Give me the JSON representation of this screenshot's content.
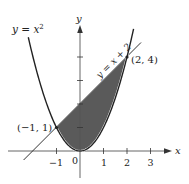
{
  "chart_data": {
    "type": "area",
    "title": "",
    "xlabel": "x",
    "ylabel": "y",
    "xlim": [
      -2.5,
      3.8
    ],
    "ylim": [
      -0.6,
      5.4
    ],
    "grid": false,
    "x_ticks": [
      -1,
      0,
      1,
      2,
      3
    ],
    "x_tick_labels": [
      "−1",
      "0",
      "1",
      "2",
      "3"
    ],
    "y_ticks": [
      1,
      2,
      3,
      4
    ],
    "series": [
      {
        "name": "y = x^2",
        "kind": "curve",
        "equation": "y = x^2",
        "x_range": [
          -2.2,
          2.28
        ]
      },
      {
        "name": "y = x + 2",
        "kind": "line",
        "equation": "y = x + 2",
        "x_range": [
          -2.4,
          2.6
        ]
      }
    ],
    "shaded_region": {
      "between": [
        "y = x + 2",
        "y = x^2"
      ],
      "x_range": [
        -1,
        2
      ],
      "color": "#5a5a5a"
    },
    "points": [
      {
        "label": "(−1, 1)",
        "x": -1,
        "y": 1
      },
      {
        "label": "(2, 4)",
        "x": 2,
        "y": 4
      }
    ],
    "annotations": [
      {
        "text": "y = x²",
        "target": "parabola"
      },
      {
        "text": "y = x + 2",
        "target": "line",
        "rotation": -45
      }
    ]
  },
  "labels": {
    "curve_lhs": "y = x",
    "curve_exp": "2",
    "line_label": "y = x + 2",
    "point_a": "(−1, 1)",
    "point_b": "(2, 4)",
    "x_axis": "x",
    "y_axis": "y",
    "tick_m1": "−1",
    "tick_0": "0",
    "tick_1": "1",
    "tick_2": "2",
    "tick_3": "3"
  },
  "colors": {
    "fill": "#5a5a5a",
    "stroke": "#222222",
    "axis": "#555555"
  }
}
